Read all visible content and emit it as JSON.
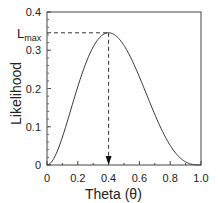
{
  "chart_data": {
    "type": "line",
    "title": "",
    "xlabel": "Theta (θ)",
    "ylabel": "Likelihood",
    "xlim": [
      0,
      1.0
    ],
    "ylim": [
      0,
      0.4
    ],
    "xticks": [
      "0",
      "0.2",
      "0.4",
      "0.6",
      "0.8",
      "1.0"
    ],
    "yticks": [
      "0",
      "0.1",
      "0.2",
      "0.3",
      "0.4"
    ],
    "grid": false,
    "legend": null,
    "series": [
      {
        "name": "Likelihood",
        "x": [
          0,
          0.05,
          0.1,
          0.15,
          0.2,
          0.25,
          0.3,
          0.35,
          0.4,
          0.45,
          0.5,
          0.55,
          0.6,
          0.65,
          0.7,
          0.75,
          0.8,
          0.85,
          0.9,
          0.95,
          1.0
        ],
        "y": [
          0,
          0.0214,
          0.0729,
          0.1382,
          0.2048,
          0.2637,
          0.3087,
          0.3364,
          0.3456,
          0.3369,
          0.3125,
          0.2757,
          0.2304,
          0.1811,
          0.1323,
          0.0879,
          0.0512,
          0.0244,
          0.0081,
          0.0012,
          0
        ]
      }
    ],
    "annotations": [
      {
        "type": "hline-dashed",
        "label": "L",
        "subscript": "max",
        "y": 0.3456,
        "x_from": 0,
        "x_to": 0.4
      },
      {
        "type": "vline-dashed-arrow",
        "x": 0.4,
        "y_from": 0.3456,
        "y_to": 0
      }
    ]
  },
  "labels": {
    "ylabel": "Likelihood",
    "xlabel": "Theta (θ)",
    "lmax_main": "L",
    "lmax_sub": "max",
    "xticks": [
      "0",
      "0.2",
      "0.4",
      "0.6",
      "0.8",
      "1.0"
    ],
    "yticks": [
      "0",
      "0.1",
      "0.2",
      "0.3",
      "0.4"
    ]
  },
  "colors": {
    "line": "#333333",
    "axis": "#333333",
    "text": "#222222"
  }
}
